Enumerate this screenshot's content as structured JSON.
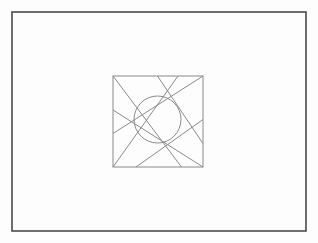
{
  "figure": {
    "type": "technical-line-drawing",
    "canvas": {
      "width": 318,
      "height": 243
    },
    "background_color": "#fdfdfd"
  },
  "outer_frame": {
    "name": "outer-border-rectangle",
    "x": 12,
    "y": 12,
    "width": 294,
    "height": 219,
    "stroke_color": "#4a4a4a",
    "stroke_width": 1.6,
    "fill": "none"
  },
  "inner_square": {
    "name": "aperture-bounding-square",
    "x": 113,
    "y": 76,
    "width": 90,
    "height": 91,
    "stroke_color": "#8a8a8a",
    "stroke_width": 1,
    "fill": "none"
  },
  "aperture": {
    "name": "iris-aperture",
    "circle": {
      "cx": 157.5,
      "cy": 119.5,
      "r": 23.5,
      "stroke_color": "#8a8a8a",
      "stroke_width": 1,
      "fill": "none"
    },
    "blade_count": 6,
    "blade_stroke_color": "#8a8a8a",
    "blade_stroke_width": 1,
    "blades": [
      {
        "id": "blade-1",
        "x1": 113,
        "y1": 76,
        "x2": 181.5,
        "y2": 167
      },
      {
        "id": "blade-2",
        "x1": 157.5,
        "y1": 76,
        "x2": 203,
        "y2": 143.5
      },
      {
        "id": "blade-3",
        "x1": 203,
        "y1": 76,
        "x2": 113,
        "y2": 133.5
      },
      {
        "id": "blade-4",
        "x1": 203,
        "y1": 119.5,
        "x2": 136,
        "y2": 167
      },
      {
        "id": "blade-5",
        "x1": 203,
        "y1": 167,
        "x2": 113,
        "y2": 110
      },
      {
        "id": "blade-6",
        "x1": 113,
        "y1": 167,
        "x2": 178,
        "y2": 76
      }
    ]
  }
}
